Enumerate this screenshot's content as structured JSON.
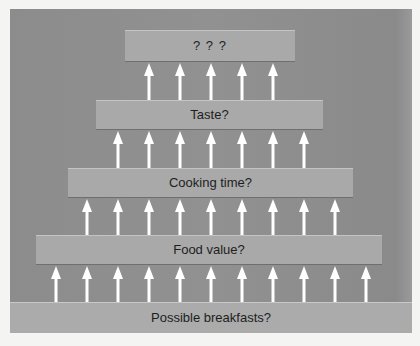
{
  "diagram": {
    "type": "hierarchy-of-filters",
    "direction": "bottom-to-top",
    "tiers": [
      {
        "label": "? ? ?",
        "arrows_in": 5
      },
      {
        "label": "Taste?",
        "arrows_in": 7
      },
      {
        "label": "Cooking time?",
        "arrows_in": 9
      },
      {
        "label": "Food value?",
        "arrows_in": 11
      },
      {
        "label": "Possible breakfasts?",
        "arrows_in": 0
      }
    ]
  },
  "colors": {
    "background": "#8f8f8f",
    "tier_fill": "#a9a9a9",
    "arrow": "#ffffff",
    "text": "#1e1e1e"
  }
}
